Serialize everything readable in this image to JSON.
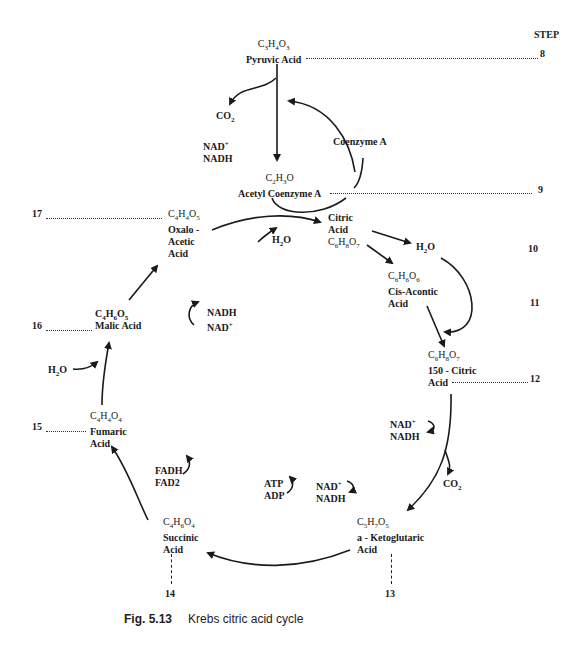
{
  "figure": {
    "number": "Fig. 5.13",
    "title": "Krebs citric acid cycle"
  },
  "step_header": "STEP",
  "compounds": {
    "pyruvic": {
      "formula": "C3H4O3",
      "name": "Pyruvic Acid",
      "step": "8"
    },
    "acetyl_coa": {
      "formula": "C2H3O",
      "name": "Acetyl Coenzyme A",
      "step": "9"
    },
    "citric": {
      "line1": "Citric",
      "line2": "Acid",
      "formula": "C6H8O7",
      "step": "10"
    },
    "cis_aconitic": {
      "formula": "C6H6O6",
      "line1": "Cis-Acontic",
      "line2": "Acid",
      "step": "11"
    },
    "isocitric": {
      "formula": "C6H8O7",
      "line1": "150 - Citric",
      "line2": "Acid",
      "step": "12"
    },
    "ketoglutaric": {
      "formula": "C5H7O5",
      "line1": "a - Ketoglutaric",
      "line2": "Acid",
      "step": "13"
    },
    "succinic": {
      "formula": "C4H6O4",
      "line1": "Succinic",
      "line2": "Acid",
      "step": "14"
    },
    "fumaric": {
      "formula": "C4H4O4",
      "line1": "Fumaric",
      "line2": "Acid",
      "step": "15"
    },
    "malic": {
      "formula": "C4H6O5",
      "name": "Malic Acid",
      "step": "16"
    },
    "oxaloacetic": {
      "formula": "C4H4O5",
      "line1": "Oxalo -",
      "line2": "Acetic",
      "line3": "Acid",
      "step": "17"
    }
  },
  "cofactors": {
    "co2_top": "CO2",
    "nad_top": "NAD+",
    "nadh_top": "NADH",
    "coenzyme_a": "Coenzyme A",
    "h2o_citric_in": "H2O",
    "h2o_citric_out": "H2O",
    "nadh_malic": "NADH",
    "nad_malic": "NAD+",
    "h2o_fumaric": "H2O",
    "nad_iso": "NAD+",
    "nadh_iso": "NADH",
    "co2_iso": "CO2",
    "fadh": "FADH",
    "fad": "FAD2",
    "atp": "ATP",
    "adp": "ADP",
    "nad_keto": "NAD +",
    "nadh_keto": "NADH"
  },
  "colors": {
    "ink": "#1a1a1a",
    "background": "#ffffff"
  }
}
